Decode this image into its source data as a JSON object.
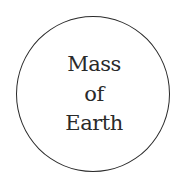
{
  "diagram": {
    "shape": "circle",
    "stroke_color": "#2a2a2a",
    "label_lines": [
      "Mass",
      "of",
      "Earth"
    ]
  }
}
